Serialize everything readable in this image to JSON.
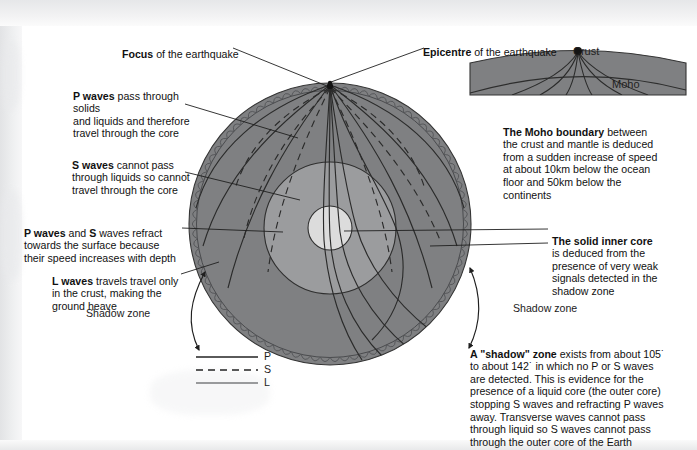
{
  "figure": {
    "colors": {
      "mantle": "#7f8082",
      "outer_core": "#9b9c9e",
      "inner_core": "#dcdcdc",
      "ray_line": "#2e2e2e",
      "l_wave_line": "#55565a",
      "text": "#111111",
      "page": "#ffffff",
      "scan_margin": "#e6e7e9"
    }
  },
  "callouts": {
    "focus": {
      "bold": "Focus",
      "rest": " of the earthquake"
    },
    "epicentre": {
      "bold": "Epicentre",
      "rest": " of the earthquake"
    },
    "p_waves": {
      "bold": "P waves",
      "rest": " pass through solids\nand liquids and therefore\ntravel through the core"
    },
    "s_waves": {
      "bold": "S waves",
      "rest": " cannot pass\nthrough liquids so cannot\ntravel through the core"
    },
    "refract": {
      "bold": "P waves",
      "mid": " and ",
      "bold2": "S",
      "rest": " waves refract\ntowards the surface because\ntheir speed increases with depth"
    },
    "l_waves": {
      "bold": "L waves",
      "rest": " travels travel only\nin the crust, making the\nground heave"
    },
    "moho": {
      "bold": "The Moho boundary",
      "rest": " between\nthe crust and mantle is deduced\nfrom a sudden increase of speed\nat about 10km below the ocean\nfloor and 50km below the\ncontinents"
    },
    "inner_core": {
      "bold": "The solid inner core",
      "rest": "\nis deduced from the\npresence of very weak\nsignals detected in the\nshadow zone"
    },
    "shadow_zone_text": {
      "bold": "A \"shadow\" zone",
      "rest": " exists from about 105˙\nto about 142˙ in which no P or S waves\nare detected. This is evidence for the\npresence of a liquid core (the outer core)\nstopping S waves and refracting P waves\naway. Transverse waves cannot pass\nthrough liquid so S waves cannot pass\nthrough the outer core of the Earth"
    },
    "shadow_zone_left": "Shadow zone",
    "shadow_zone_right": "Shadow zone"
  },
  "inset": {
    "crust_label": "Crust",
    "moho_label": "Moho"
  },
  "legend": {
    "items": [
      {
        "label": "P",
        "style": "solid"
      },
      {
        "label": "S",
        "style": "dashed"
      },
      {
        "label": "L",
        "style": "solid-light"
      }
    ]
  }
}
